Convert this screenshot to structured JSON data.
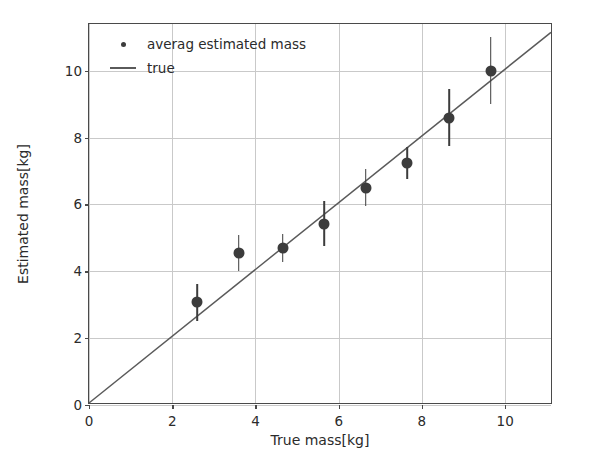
{
  "chart_data": {
    "type": "scatter",
    "title": "",
    "xlabel": "True mass[kg]",
    "ylabel": "Estimated mass[kg]",
    "xlim": [
      0,
      11.15
    ],
    "ylim": [
      0,
      11.4
    ],
    "xticks": [
      "0",
      "2",
      "4",
      "6",
      "8",
      "10"
    ],
    "xtick_values": [
      0,
      2,
      4,
      6,
      8,
      10
    ],
    "yticks": [
      "0",
      "2",
      "4",
      "6",
      "8",
      "10"
    ],
    "ytick_values": [
      0,
      2,
      4,
      6,
      8,
      10
    ],
    "grid": true,
    "legend_position": "upper left",
    "legend": [
      "averag estimated mass",
      "true"
    ],
    "series": [
      {
        "name": "averag estimated mass",
        "type": "scatter-errorbar",
        "color": "#3c3c3c",
        "x": [
          2.6,
          3.6,
          4.65,
          5.65,
          6.65,
          7.65,
          8.65,
          9.65
        ],
        "y": [
          3.07,
          4.55,
          4.7,
          5.43,
          6.5,
          7.25,
          8.6,
          10.0
        ],
        "yerr": [
          0.55,
          0.55,
          0.42,
          0.68,
          0.55,
          0.48,
          0.85,
          1.0
        ]
      },
      {
        "name": "true",
        "type": "line",
        "color": "#5a5a5a",
        "x": [
          0,
          11.15
        ],
        "y": [
          0,
          11.15
        ]
      }
    ]
  },
  "legend": {
    "item_0": "averag estimated mass",
    "item_1": "true"
  },
  "axes": {
    "xlabel": "True mass[kg]",
    "ylabel": "Estimated mass[kg]"
  },
  "colors": {
    "marker": "#3c3c3c",
    "errorbar": "#474747",
    "line": "#5a5a5a",
    "grid": "#c9c9c9",
    "frame": "#4a4a4a",
    "background": "#ffffff"
  }
}
